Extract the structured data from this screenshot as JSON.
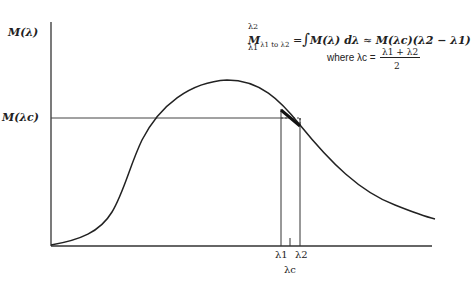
{
  "diagram": {
    "y_axis_label": "M(λ)",
    "y_level_label": "M(λc)",
    "x_labels": {
      "lambda1": "λ1",
      "lambda2": "λ2",
      "lambda_c": "λc"
    },
    "equation": {
      "lhs_base": "M",
      "lhs_sub": "λ1 to λ2",
      "integral_upper": "λ2",
      "integral_lower": "λ1",
      "integrand": "M(λ) dλ",
      "approx": "≈",
      "rhs": "M(λc)(λ2 − λ1)"
    },
    "where": {
      "text": "where λc =",
      "numerator": "λ1 + λ2",
      "denominator": "2"
    },
    "colors": {
      "line": "#222222",
      "guide": "#555555"
    }
  }
}
